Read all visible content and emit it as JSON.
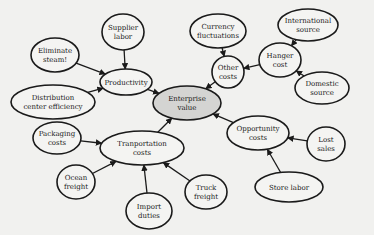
{
  "diagram": {
    "type": "influence-diagram",
    "center_node": "enterprise-value",
    "nodes": [
      {
        "id": "supplier-labor",
        "lines": [
          "Supplier",
          "labor"
        ],
        "cx": 123,
        "cy": 32,
        "rx": 21,
        "ry": 18
      },
      {
        "id": "eliminate-steam",
        "lines": [
          "Eliminate",
          "steam!"
        ],
        "cx": 55,
        "cy": 55,
        "rx": 24,
        "ry": 17
      },
      {
        "id": "distribution-center-efficiency",
        "lines": [
          "Distribution",
          "center efficiency"
        ],
        "cx": 53,
        "cy": 102,
        "rx": 42,
        "ry": 17
      },
      {
        "id": "productivity",
        "lines": [
          "Productivity"
        ],
        "cx": 126,
        "cy": 82,
        "rx": 26,
        "ry": 13
      },
      {
        "id": "enterprise-value",
        "lines": [
          "Enterprise",
          "value"
        ],
        "cx": 187,
        "cy": 103,
        "rx": 34,
        "ry": 17,
        "center": true
      },
      {
        "id": "currency-fluctuations",
        "lines": [
          "Currency",
          "fluctuations"
        ],
        "cx": 218,
        "cy": 31,
        "rx": 28,
        "ry": 17
      },
      {
        "id": "other-costs",
        "lines": [
          "Other",
          "costs"
        ],
        "cx": 228,
        "cy": 72,
        "rx": 16,
        "ry": 16
      },
      {
        "id": "hanger-cost",
        "lines": [
          "Hanger",
          "cost"
        ],
        "cx": 280,
        "cy": 60,
        "rx": 21,
        "ry": 17
      },
      {
        "id": "international-source",
        "lines": [
          "International",
          "source"
        ],
        "cx": 308,
        "cy": 25,
        "rx": 30,
        "ry": 16
      },
      {
        "id": "domestic-source",
        "lines": [
          "Domestic",
          "source"
        ],
        "cx": 322,
        "cy": 88,
        "rx": 27,
        "ry": 16
      },
      {
        "id": "packaging-costs",
        "lines": [
          "Packaging",
          "costs"
        ],
        "cx": 57,
        "cy": 138,
        "rx": 24,
        "ry": 16
      },
      {
        "id": "transportation-costs",
        "lines": [
          "Tranportation",
          "costs"
        ],
        "cx": 142,
        "cy": 148,
        "rx": 42,
        "ry": 17
      },
      {
        "id": "ocean-freight",
        "lines": [
          "Ocean",
          "freight"
        ],
        "cx": 76,
        "cy": 182,
        "rx": 19,
        "ry": 17
      },
      {
        "id": "import-duties",
        "lines": [
          "Import",
          "duties"
        ],
        "cx": 149,
        "cy": 211,
        "rx": 23,
        "ry": 18
      },
      {
        "id": "truck-freight",
        "lines": [
          "Truck",
          "freight"
        ],
        "cx": 206,
        "cy": 192,
        "rx": 21,
        "ry": 17
      },
      {
        "id": "opportunity-costs",
        "lines": [
          "Opportunity",
          "costs"
        ],
        "cx": 258,
        "cy": 133,
        "rx": 31,
        "ry": 17
      },
      {
        "id": "lost-sales",
        "lines": [
          "Lost",
          "sales"
        ],
        "cx": 326,
        "cy": 144,
        "rx": 19,
        "ry": 17
      },
      {
        "id": "store-labor",
        "lines": [
          "Store labor"
        ],
        "cx": 289,
        "cy": 187,
        "rx": 34,
        "ry": 15
      }
    ],
    "edges": [
      {
        "from": "supplier-labor",
        "to": "productivity"
      },
      {
        "from": "eliminate-steam",
        "to": "productivity"
      },
      {
        "from": "distribution-center-efficiency",
        "to": "productivity"
      },
      {
        "from": "productivity",
        "to": "enterprise-value"
      },
      {
        "from": "currency-fluctuations",
        "to": "other-costs"
      },
      {
        "from": "hanger-cost",
        "to": "other-costs"
      },
      {
        "from": "international-source",
        "to": "hanger-cost"
      },
      {
        "from": "domestic-source",
        "to": "hanger-cost"
      },
      {
        "from": "other-costs",
        "to": "enterprise-value"
      },
      {
        "from": "packaging-costs",
        "to": "transportation-costs"
      },
      {
        "from": "ocean-freight",
        "to": "transportation-costs"
      },
      {
        "from": "import-duties",
        "to": "transportation-costs"
      },
      {
        "from": "truck-freight",
        "to": "transportation-costs"
      },
      {
        "from": "transportation-costs",
        "to": "enterprise-value"
      },
      {
        "from": "lost-sales",
        "to": "opportunity-costs"
      },
      {
        "from": "store-labor",
        "to": "opportunity-costs"
      },
      {
        "from": "opportunity-costs",
        "to": "enterprise-value"
      }
    ],
    "colors": {
      "background": "#f1f1ef",
      "node_fill": "#f4f4f2",
      "center_fill": "#d4d4d2",
      "stroke": "#1a1a1a"
    }
  }
}
